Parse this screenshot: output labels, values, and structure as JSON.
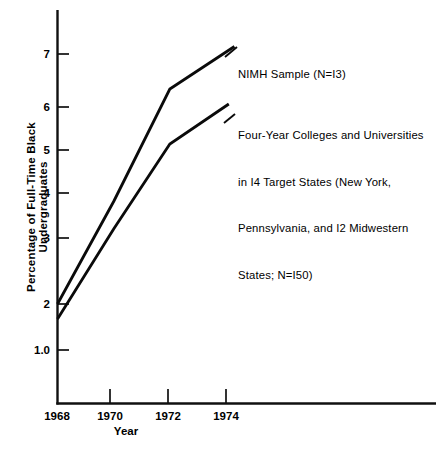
{
  "chart_data": {
    "type": "line",
    "title": "",
    "xlabel": "Year",
    "ylabel": "Percentage of Full-Time Black Undergraduates",
    "grid": false,
    "legend_position": "inline-annotations",
    "xlim": [
      1968,
      1975.2
    ],
    "ylim": [
      0,
      7.6
    ],
    "x_ticks": [
      1968,
      1970,
      1972,
      1974
    ],
    "x_tick_labels": [
      "1968",
      "1970",
      "1972",
      "1974"
    ],
    "y_ticks": [
      1.0,
      2,
      3,
      4,
      5,
      6,
      7
    ],
    "y_tick_labels": [
      "1.0",
      "2",
      "3",
      "4",
      "5",
      "6",
      "7"
    ],
    "series": [
      {
        "name": "NIMH Sample (N=I3)",
        "x": [
          1968,
          1970,
          1972,
          1974.3
        ],
        "values": [
          2.0,
          4.05,
          6.3,
          7.15
        ]
      },
      {
        "name": "Four-Year Colleges and Universities in I4 Target States (New York, Pennsylvania, and I2 Midwestern States; N=I50)",
        "x": [
          1968,
          1970,
          1972,
          1974.1
        ],
        "values": [
          1.7,
          3.5,
          5.2,
          6.0
        ]
      }
    ],
    "annotations": [
      {
        "id": "nimh",
        "lines": [
          "NIMH Sample (N=I3)"
        ]
      },
      {
        "id": "four-year",
        "lines": [
          "Four-Year Colleges and Universities",
          "in I4 Target States (New York,",
          "Pennsylvania, and I2 Midwestern",
          "States; N=I50)"
        ]
      }
    ],
    "colors": {
      "line": "#0a0a0a",
      "axis": "#101010",
      "background": "#ffffff"
    }
  }
}
